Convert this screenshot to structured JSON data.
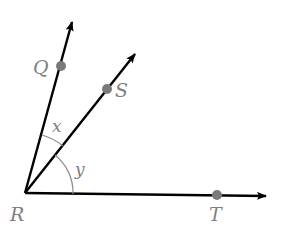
{
  "diagram": {
    "type": "angle-rays",
    "vertex": {
      "label": "R",
      "x": 25,
      "y": 193
    },
    "rays": [
      {
        "name": "RQ",
        "point_label": "Q",
        "point": {
          "x": 61,
          "y": 66
        },
        "tip": {
          "x": 73,
          "y": 20
        }
      },
      {
        "name": "RS",
        "point_label": "S",
        "point": {
          "x": 107,
          "y": 89
        },
        "tip": {
          "x": 136,
          "y": 52
        }
      },
      {
        "name": "RT",
        "point_label": "T",
        "point": {
          "x": 217,
          "y": 195
        },
        "tip": {
          "x": 268,
          "y": 196
        }
      }
    ],
    "angles": [
      {
        "label": "x",
        "between": [
          "RQ",
          "RS"
        ]
      },
      {
        "label": "y",
        "between": [
          "RS",
          "RT"
        ]
      }
    ],
    "colors": {
      "ray": "#000000",
      "point": "#7a7a7a",
      "label": "#808080",
      "arc": "#8c8c8c"
    }
  },
  "labels": {
    "Q": "Q",
    "S": "S",
    "T": "T",
    "R": "R",
    "x": "x",
    "y": "y"
  }
}
